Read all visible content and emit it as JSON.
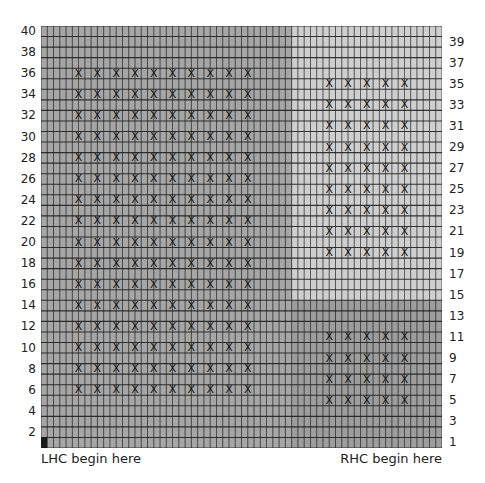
{
  "chart": {
    "type": "knitting-chart",
    "columns": 64,
    "rows": 40,
    "colors": {
      "left_block": "#a6a6a6",
      "right_upper_block": "#cfcfcf",
      "right_lower_block": "#9d9d9d",
      "grid_line": "#1a1a1a",
      "start_stitch": "#1a1a1a"
    },
    "blocks": [
      {
        "name": "left",
        "col_start": 0,
        "col_end": 40,
        "row_start": 1,
        "row_end": 40,
        "color_key": "left_block"
      },
      {
        "name": "right-upper",
        "col_start": 40,
        "col_end": 64,
        "row_start": 15,
        "row_end": 40,
        "color_key": "right_upper_block"
      },
      {
        "name": "right-lower",
        "col_start": 40,
        "col_end": 64,
        "row_start": 1,
        "row_end": 14,
        "color_key": "right_lower_block"
      }
    ],
    "cables": [
      {
        "block": "left",
        "boundary_cols": [
          6,
          9,
          12,
          15,
          18,
          21,
          24,
          27,
          30,
          33
        ],
        "rows": [
          6,
          8,
          10,
          12,
          14,
          16,
          18,
          20,
          22,
          24,
          26,
          28,
          30,
          32,
          34,
          36
        ]
      },
      {
        "block": "right-upper",
        "boundary_cols": [
          46,
          49,
          52,
          55,
          58
        ],
        "rows": [
          19,
          21,
          23,
          25,
          27,
          29,
          31,
          33,
          35
        ]
      },
      {
        "block": "right-lower",
        "boundary_cols": [
          46,
          49,
          52,
          55,
          58
        ],
        "rows": [
          5,
          7,
          9,
          11
        ]
      }
    ],
    "cable_symbol": "X",
    "start_stitch": {
      "col": 0,
      "row": 1
    },
    "left_row_labels": [
      "40",
      "38",
      "36",
      "34",
      "32",
      "30",
      "28",
      "26",
      "24",
      "22",
      "20",
      "18",
      "16",
      "14",
      "12",
      "10",
      "8",
      "6",
      "4",
      "2"
    ],
    "right_row_labels": [
      "39",
      "37",
      "35",
      "33",
      "31",
      "29",
      "27",
      "25",
      "23",
      "21",
      "19",
      "17",
      "15",
      "13",
      "11",
      "9",
      "7",
      "5",
      "3",
      "1"
    ]
  },
  "captions": {
    "lhc": "LHC begin here",
    "rhc": "RHC begin here"
  }
}
